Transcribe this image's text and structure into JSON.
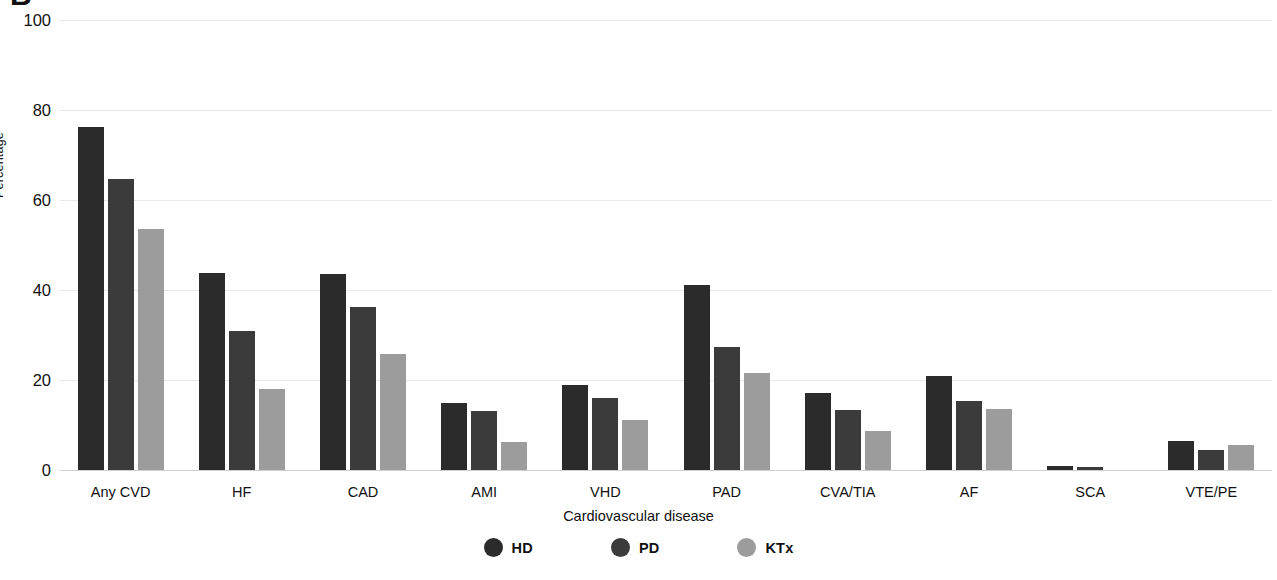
{
  "panel_label": "B",
  "chart_data": {
    "type": "bar",
    "title": "",
    "subtitle": "",
    "xlabel": "Cardiovascular disease",
    "ylabel": "Percentage",
    "ylim": [
      0,
      100
    ],
    "yticks": [
      0,
      20,
      40,
      60,
      80,
      100
    ],
    "ytick_labels": [
      "0",
      "20",
      "40",
      "60",
      "80",
      "100"
    ],
    "grid": "horizontal",
    "legend_position": "bottom-center",
    "categories": [
      "Any CVD",
      "HF",
      "CAD",
      "AMI",
      "VHD",
      "PAD",
      "CVA/TIA",
      "AF",
      "SCA",
      "VTE/PE"
    ],
    "series": [
      {
        "name": "HD",
        "color": "#2b2b2b",
        "values": [
          76.2,
          43.8,
          43.5,
          15.0,
          19.0,
          41.2,
          17.2,
          21.0,
          1.0,
          6.5
        ]
      },
      {
        "name": "PD",
        "color": "#3b3b3b",
        "values": [
          64.6,
          30.9,
          36.2,
          13.1,
          16.0,
          27.3,
          13.4,
          15.3,
          0.6,
          4.5
        ]
      },
      {
        "name": "KTx",
        "color": "#9c9c9c",
        "values": [
          53.5,
          18.0,
          25.8,
          6.2,
          11.2,
          21.6,
          8.6,
          13.6,
          0.0,
          5.5
        ]
      }
    ]
  },
  "legend": {
    "items": [
      {
        "label": "HD",
        "marker": "circle-marker",
        "color": "#2b2b2b"
      },
      {
        "label": "PD",
        "marker": "circle-marker",
        "color": "#3b3b3b"
      },
      {
        "label": "KTx",
        "marker": "circle-marker",
        "color": "#9c9c9c"
      }
    ]
  }
}
